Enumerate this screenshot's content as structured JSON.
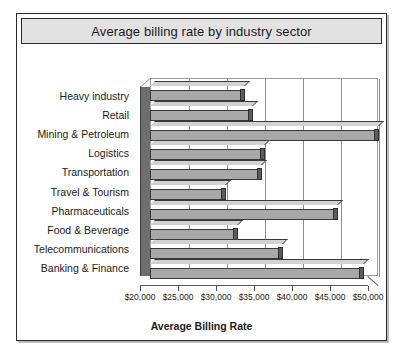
{
  "chart_data": {
    "type": "bar",
    "orientation": "horizontal",
    "title": "Average billing rate by industry sector",
    "xlabel": "Average Billing Rate",
    "ylabel": "",
    "categories": [
      "Heavy industry",
      "Retail",
      "Mining & Petroleum",
      "Logistics",
      "Transportation",
      "Travel & Tourism",
      "Pharmaceuticals",
      "Food & Beverage",
      "Telecommunications",
      "Banking & Finance"
    ],
    "values": [
      32500,
      33500,
      50100,
      35100,
      34700,
      30000,
      44700,
      31600,
      37500,
      48200
    ],
    "xlim": [
      20000,
      50000
    ],
    "xticks": [
      20000,
      25000,
      30000,
      35000,
      40000,
      45000,
      50000
    ],
    "xtick_labels": [
      "$20,000",
      "$25,000",
      "$30,000",
      "$35,000",
      "$40,000",
      "$45,000",
      "$50,000"
    ],
    "grid": "vertical",
    "legend": "none",
    "style": "3d-bars",
    "colors": {
      "bar_front": "#a8a8a8",
      "bar_top": "#d2d2d2",
      "bar_cap": "#5c5c5c",
      "bar_outline": "#3a3a3a",
      "plot_background": "#ffffff",
      "gridline": "#8e8e8e",
      "title_bar_background": "#e2e2e2",
      "frame_border": "#2b2b2b",
      "text": "#1b1b1b"
    }
  }
}
